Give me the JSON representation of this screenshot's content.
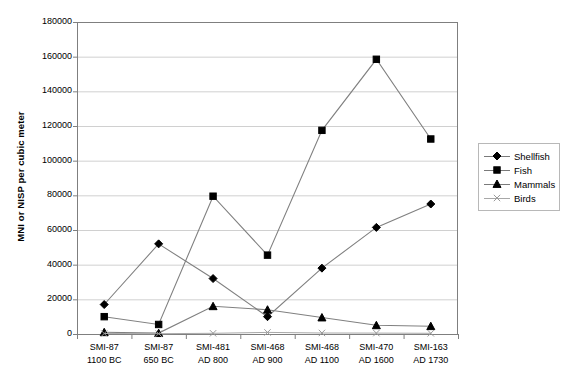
{
  "chart_data": {
    "type": "line",
    "title": "",
    "xlabel": "",
    "ylabel": "MNI or NISP per cubic meter",
    "ylim": [
      0,
      180000
    ],
    "ytick_step": 20000,
    "grid": true,
    "legend_position": "right",
    "yticks": [
      "0",
      "20000",
      "40000",
      "60000",
      "80000",
      "100000",
      "120000",
      "140000",
      "160000",
      "180000"
    ],
    "categories": [
      {
        "site": "SMI-87",
        "date": "1100 BC"
      },
      {
        "site": "SMI-87",
        "date": "650 BC"
      },
      {
        "site": "SMI-481",
        "date": "AD 800"
      },
      {
        "site": "SMI-468",
        "date": "AD 900"
      },
      {
        "site": "SMI-468",
        "date": "AD 1100"
      },
      {
        "site": "SMI-470",
        "date": "AD 1600"
      },
      {
        "site": "SMI-163",
        "date": "AD 1730"
      }
    ],
    "series": [
      {
        "name": "Shellfish",
        "marker": "diamond",
        "values": [
          17000,
          52000,
          32000,
          10000,
          38000,
          61500,
          75000
        ]
      },
      {
        "name": "Fish",
        "marker": "square",
        "values": [
          10000,
          5500,
          79500,
          45500,
          117500,
          158500,
          112500
        ]
      },
      {
        "name": "Mammals",
        "marker": "triangle",
        "values": [
          1000,
          500,
          16000,
          14000,
          9500,
          5000,
          4500
        ]
      },
      {
        "name": "Birds",
        "marker": "cross",
        "values": [
          300,
          200,
          400,
          900,
          600,
          500,
          400
        ]
      }
    ]
  },
  "legend": {
    "entries": [
      "Shellfish",
      "Fish",
      "Mammals",
      "Birds"
    ]
  },
  "colors": {
    "series_line": "#808080",
    "marker": "#000000",
    "grid": "#d0d0d0",
    "axis": "#7f7f7f",
    "legend_border": "#b8b8b8",
    "background": "#ffffff"
  }
}
